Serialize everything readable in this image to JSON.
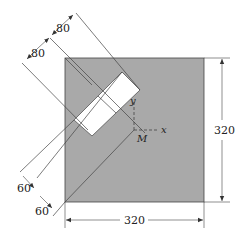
{
  "figure": {
    "plate": {
      "width_label": "320",
      "height_label": "320",
      "fill": "#a9a9a9"
    },
    "strip_dimensions": {
      "upper_a": "80",
      "upper_b": "80",
      "lower_a": "60",
      "lower_b": "60"
    },
    "axes": {
      "x_label": "x",
      "y_label": "y",
      "origin_label": "M"
    },
    "colors": {
      "plate": "#a9a9a9",
      "cutout": "#ffffff",
      "line": "#333333"
    }
  }
}
